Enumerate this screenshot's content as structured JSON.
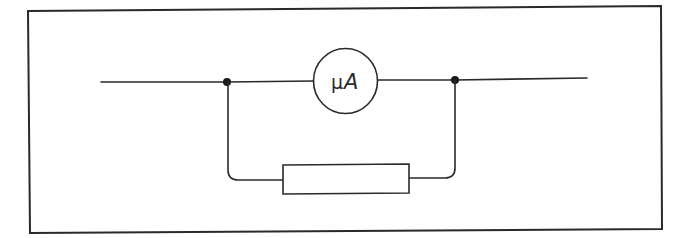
{
  "diagram": {
    "type": "circuit-schematic",
    "components": [
      {
        "id": "meter",
        "kind": "ammeter",
        "label_prefix": "μ",
        "label_unit": "A"
      },
      {
        "id": "shunt",
        "kind": "resistor",
        "label": ""
      }
    ],
    "junctions": [
      {
        "id": "left-junction"
      },
      {
        "id": "right-junction"
      }
    ],
    "colors": {
      "line": "#2a2a2a",
      "background": "#ffffff"
    }
  }
}
